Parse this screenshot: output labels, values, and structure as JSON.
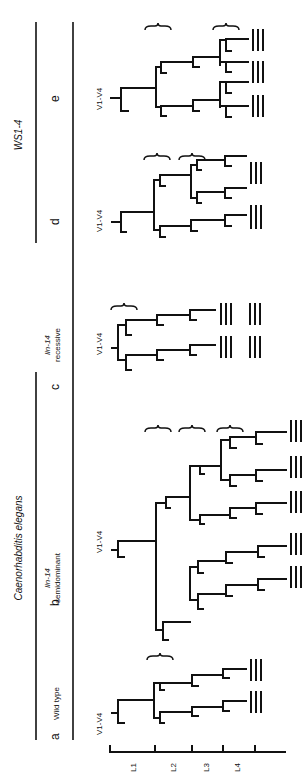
{
  "figure": {
    "organism_title": "Caenorhabditis elegans",
    "comparison_title": "WS1-4",
    "orientation": "rotated 90deg counter-clockwise",
    "panels": [
      {
        "id": "a",
        "label": "a",
        "title": "Wild type",
        "title_italic_part": "",
        "cells": "V1-V4",
        "lineage_branches": 2,
        "vulval_marks": 2,
        "braces": 1
      },
      {
        "id": "b",
        "label": "b",
        "title": "semidominant",
        "title_italic_part": "lin-14",
        "cells": "V1-V4",
        "lineage_branches": 5,
        "vulval_marks": 5,
        "braces": 3
      },
      {
        "id": "c",
        "label": "c",
        "title": "recessive",
        "title_italic_part": "lin-14",
        "cells": "V1-V4",
        "lineage_branches": 2,
        "vulval_marks": 4,
        "braces": 1
      },
      {
        "id": "d",
        "label": "d",
        "title": "",
        "title_italic_part": "",
        "cells": "V1-V4",
        "lineage_branches": 3,
        "vulval_marks": 3,
        "braces": 2
      },
      {
        "id": "e",
        "label": "e",
        "title": "",
        "title_italic_part": "",
        "cells": "V1-V4",
        "lineage_branches": 4,
        "vulval_marks": 3,
        "braces": 2
      }
    ],
    "time_axis": {
      "labels": [
        "L1",
        "L2",
        "L3",
        "L4"
      ]
    }
  }
}
